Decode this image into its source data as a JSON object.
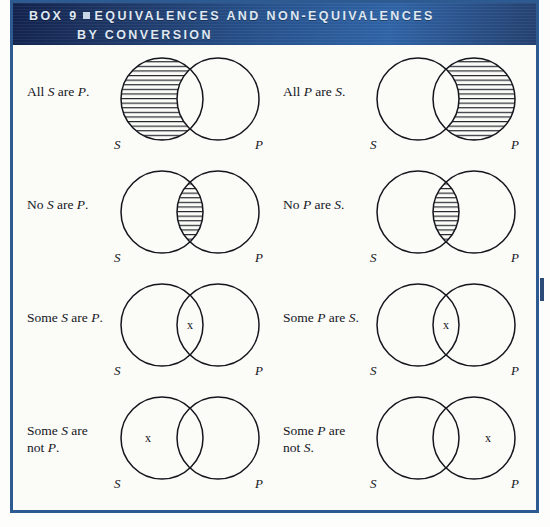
{
  "header": {
    "box_label": "BOX 9",
    "bullet_icon": "filled-square-bullet",
    "title_line1": "EQUIVALENCES AND NON-EQUIVALENCES",
    "title_line2": "BY CONVERSION",
    "background_color": "#27528c",
    "text_color": "#dfe7f2"
  },
  "frame": {
    "border_color": "#2e5a92",
    "background_color": "#fbfbf8"
  },
  "diagram_defaults": {
    "circle_label_left": "S",
    "circle_label_right": "P",
    "x_mark": "x",
    "circle_stroke_color": "#14161c",
    "hatch_color": "#14161c"
  },
  "cells": [
    {
      "id": "all-s-are-p",
      "row": 1,
      "column": "left",
      "statement_lines": [
        "All |S| are |P|."
      ],
      "shading": "left-crescent",
      "x_position": "none",
      "label_left": "S",
      "label_right": "P"
    },
    {
      "id": "all-p-are-s",
      "row": 1,
      "column": "right",
      "statement_lines": [
        "All |P| are |S|."
      ],
      "shading": "right-crescent",
      "x_position": "none",
      "label_left": "S",
      "label_right": "P"
    },
    {
      "id": "no-s-are-p",
      "row": 2,
      "column": "left",
      "statement_lines": [
        "No |S| are |P|."
      ],
      "shading": "intersection",
      "x_position": "none",
      "label_left": "S",
      "label_right": "P"
    },
    {
      "id": "no-p-are-s",
      "row": 2,
      "column": "right",
      "statement_lines": [
        "No |P| are |S|."
      ],
      "shading": "intersection",
      "x_position": "none",
      "label_left": "S",
      "label_right": "P"
    },
    {
      "id": "some-s-are-p",
      "row": 3,
      "column": "left",
      "statement_lines": [
        "Some |S| are |P|."
      ],
      "shading": "none",
      "x_position": "intersection",
      "label_left": "S",
      "label_right": "P"
    },
    {
      "id": "some-p-are-s",
      "row": 3,
      "column": "right",
      "statement_lines": [
        "Some |P| are |S|."
      ],
      "shading": "none",
      "x_position": "intersection",
      "label_left": "S",
      "label_right": "P"
    },
    {
      "id": "some-s-are-not-p",
      "row": 4,
      "column": "left",
      "statement_lines": [
        "Some |S| are",
        "not |P|."
      ],
      "shading": "none",
      "x_position": "left-crescent",
      "label_left": "S",
      "label_right": "P"
    },
    {
      "id": "some-p-are-not-s",
      "row": 4,
      "column": "right",
      "statement_lines": [
        "Some |P| are",
        "not |S|."
      ],
      "shading": "none",
      "x_position": "right-crescent",
      "label_left": "S",
      "label_right": "P"
    }
  ]
}
